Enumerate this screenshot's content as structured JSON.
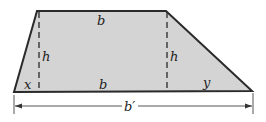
{
  "diagram": {
    "shape": "trapezoid",
    "colors": {
      "fill": "#d4d4d4",
      "stroke": "#2a2a2a",
      "background": "#ffffff"
    },
    "labels": {
      "top_base": "b",
      "bottom_middle": "b",
      "left_height": "h",
      "right_height": "h",
      "left_segment": "x",
      "right_segment": "y",
      "total_base": "b′"
    }
  }
}
